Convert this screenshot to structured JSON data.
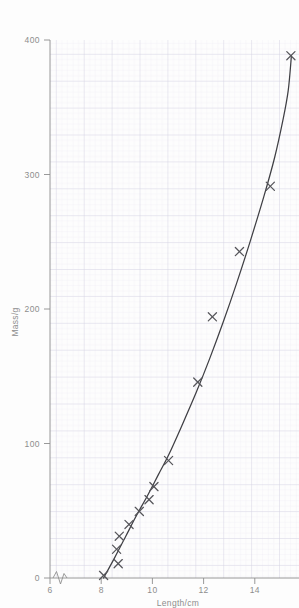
{
  "chart_data": {
    "type": "scatter",
    "title": "",
    "subtitle": "",
    "xlabel": "Length/cm",
    "ylabel": "Mass/g",
    "xlim": [
      6,
      15.2
    ],
    "ylim": [
      0,
      412
    ],
    "x_ticks": [
      6,
      8,
      10,
      12,
      14
    ],
    "x_tick_labels": [
      "6",
      "8",
      "10",
      "12",
      "14"
    ],
    "y_ticks": [
      0,
      100,
      200,
      300,
      400
    ],
    "y_tick_labels": [
      "0",
      "100",
      "200",
      "300",
      "400"
    ],
    "grid": "graph-paper, minor 0.1 units, major 0.5 units",
    "legend": "none",
    "axis_break": "x-axis zigzag break between 0 and 6",
    "marker": "cross",
    "marker_color": "#55555a",
    "line_color": "#3f3f44",
    "grid_minor_color": "#eceaf2",
    "grid_major_color": "#d8d5e2",
    "axis_color": "#8d8d8d",
    "background": "#fdfdfd",
    "series": [
      {
        "name": "measurements",
        "points": [
          {
            "x": 7.98,
            "y": 2
          },
          {
            "x": 8.52,
            "y": 11
          },
          {
            "x": 8.46,
            "y": 22
          },
          {
            "x": 8.56,
            "y": 32
          },
          {
            "x": 8.92,
            "y": 41
          },
          {
            "x": 9.3,
            "y": 51
          },
          {
            "x": 9.66,
            "y": 60
          },
          {
            "x": 9.84,
            "y": 70
          },
          {
            "x": 10.38,
            "y": 90
          },
          {
            "x": 11.46,
            "y": 150
          },
          {
            "x": 12.0,
            "y": 200
          },
          {
            "x": 13.0,
            "y": 250
          },
          {
            "x": 14.14,
            "y": 300
          },
          {
            "x": 14.9,
            "y": 400
          }
        ]
      }
    ],
    "best_fit_curve": {
      "name": "line-of-best-fit",
      "path_points": [
        {
          "x": 7.98,
          "y": 0
        },
        {
          "x": 8.4,
          "y": 16
        },
        {
          "x": 8.8,
          "y": 32
        },
        {
          "x": 9.2,
          "y": 48
        },
        {
          "x": 9.6,
          "y": 63
        },
        {
          "x": 10.0,
          "y": 79
        },
        {
          "x": 10.4,
          "y": 95
        },
        {
          "x": 10.9,
          "y": 118
        },
        {
          "x": 11.4,
          "y": 142
        },
        {
          "x": 11.9,
          "y": 168
        },
        {
          "x": 12.4,
          "y": 196
        },
        {
          "x": 12.9,
          "y": 226
        },
        {
          "x": 13.4,
          "y": 258
        },
        {
          "x": 13.9,
          "y": 292
        },
        {
          "x": 14.3,
          "y": 322
        },
        {
          "x": 14.6,
          "y": 350
        },
        {
          "x": 14.8,
          "y": 373
        },
        {
          "x": 14.92,
          "y": 400
        }
      ]
    }
  }
}
